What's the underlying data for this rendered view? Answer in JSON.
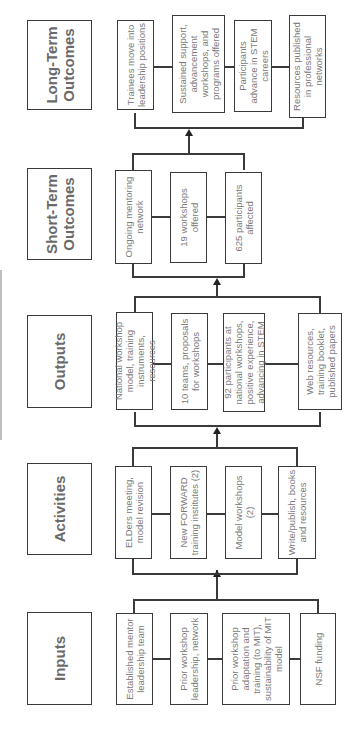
{
  "orientation": "rotated 90° counter-clockwise",
  "colors": {
    "border": "#3a3a3a",
    "header_text": "#6a6a6a",
    "item_text": "#7a7a7a",
    "background": "#ffffff"
  },
  "columns": [
    {
      "header": "Inputs",
      "items": [
        "Established mentor leadership team",
        "Prior workshop leadership, network",
        "Prior workshop adaptation and training (to MIT), sustainability of MIT model",
        "NSF funding"
      ]
    },
    {
      "header": "Activities",
      "items": [
        "ELDers meeting, model revision",
        "New FORWARD training institutes (2)",
        "Model workshops (2)",
        "Write/publish, books and resources"
      ]
    },
    {
      "header": "Outputs",
      "items": [
        "National workshop model, training instruments, resources",
        "10 teams, proposals for workshops",
        "92 participants at national workshops, positive experience, advancing in STEM",
        "Web resources, training booklet, published papers"
      ]
    },
    {
      "header": "Short-Term Outcomes",
      "items": [
        "Ongoing mentoring network",
        "19 workshops offered",
        "625 participants affected"
      ]
    },
    {
      "header": "Long-Term Outcomes",
      "items": [
        "Trainees move into leadership positions",
        "Sustained support, advancement workshops, and programs offered",
        "Participants advance in STEM careers",
        "Resources published in professional networks"
      ]
    }
  ]
}
